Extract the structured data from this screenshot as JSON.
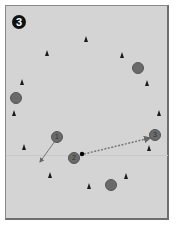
{
  "diagram": {
    "step_badge": "3",
    "colors": {
      "field": "#d4d4d4",
      "cone": "#1a1a1a",
      "player": "#6a6a6a",
      "arrow": "#777777"
    },
    "cones": [
      {
        "x": 86,
        "y": 39
      },
      {
        "x": 47,
        "y": 53
      },
      {
        "x": 122,
        "y": 55
      },
      {
        "x": 22,
        "y": 82
      },
      {
        "x": 147,
        "y": 83
      },
      {
        "x": 14,
        "y": 113
      },
      {
        "x": 159,
        "y": 113
      },
      {
        "x": 24,
        "y": 147
      },
      {
        "x": 149,
        "y": 148
      },
      {
        "x": 50,
        "y": 175
      },
      {
        "x": 126,
        "y": 176
      },
      {
        "x": 89,
        "y": 186
      }
    ],
    "players": [
      {
        "id": "p-a",
        "label": "",
        "x": 138,
        "y": 68
      },
      {
        "id": "p-b",
        "label": "",
        "x": 16,
        "y": 98
      },
      {
        "id": "p-1",
        "label": "1",
        "x": 57,
        "y": 137
      },
      {
        "id": "p-2",
        "label": "2",
        "x": 74,
        "y": 158
      },
      {
        "id": "p-3",
        "label": "3",
        "x": 155,
        "y": 135
      },
      {
        "id": "p-c",
        "label": "",
        "x": 111,
        "y": 185
      }
    ],
    "ball": {
      "x": 82,
      "y": 154
    },
    "movements": [
      {
        "type": "run",
        "style": "solid",
        "from": [
          55,
          141
        ],
        "to": [
          40,
          162
        ]
      },
      {
        "type": "pass",
        "style": "dotted",
        "from": [
          84,
          154
        ],
        "to": [
          150,
          138
        ]
      }
    ]
  }
}
